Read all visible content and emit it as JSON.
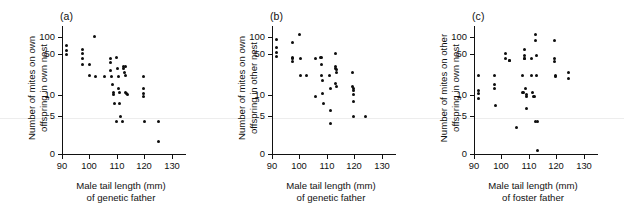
{
  "figure": {
    "background": "#ffffff",
    "point_color": "#0d0d0d",
    "axis_color": "#111111"
  },
  "panels": [
    {
      "key": "a",
      "label": "(a)",
      "ylabel_line1": "Number of mites on own",
      "ylabel_line2": "offspring in own nest",
      "xlabel_line1": "Male tail length (mm)",
      "xlabel_line2": "of genetic father"
    },
    {
      "key": "b",
      "label": "(b)",
      "ylabel_line1": "Number of mites on own",
      "ylabel_line2": "offspring in other nest",
      "xlabel_line1": "Male tail length (mm)",
      "xlabel_line2": "of genetic father"
    },
    {
      "key": "c",
      "label": "(c)",
      "ylabel_line1": "Number of mites on other",
      "ylabel_line2": "offspring in own nest",
      "xlabel_line1": "Male tail length (mm)",
      "xlabel_line2": "of foster father"
    }
  ],
  "chart_data": [
    {
      "type": "scatter",
      "panel": "a",
      "title": "(a)",
      "xlabel": "Male tail length (mm) of genetic father",
      "ylabel": "Number of mites on own offspring in own nest",
      "xlim": [
        90,
        133
      ],
      "xticks": [
        90,
        100,
        110,
        120,
        130
      ],
      "xtick_labels": [
        "90",
        "100",
        "110",
        "120",
        "130"
      ],
      "yscale": "log-like-broken",
      "yticks": [
        0,
        5,
        10,
        50,
        100
      ],
      "ytick_labels": [
        "0",
        "5",
        "10",
        "50",
        "100"
      ],
      "grid": false,
      "legend": null,
      "points": [
        {
          "x": 91.5,
          "y": 70
        },
        {
          "x": 91.5,
          "y": 58
        },
        {
          "x": 91.5,
          "y": 50
        },
        {
          "x": 97.5,
          "y": 60
        },
        {
          "x": 97.5,
          "y": 52
        },
        {
          "x": 97.5,
          "y": 43
        },
        {
          "x": 97.5,
          "y": 33
        },
        {
          "x": 100.0,
          "y": 33
        },
        {
          "x": 100.0,
          "y": 22
        },
        {
          "x": 101.8,
          "y": 100
        },
        {
          "x": 102.2,
          "y": 21
        },
        {
          "x": 105.5,
          "y": 21
        },
        {
          "x": 107.8,
          "y": 43
        },
        {
          "x": 107.8,
          "y": 37
        },
        {
          "x": 107.8,
          "y": 26
        },
        {
          "x": 108.0,
          "y": 21
        },
        {
          "x": 108.5,
          "y": 15
        },
        {
          "x": 108.7,
          "y": 11
        },
        {
          "x": 108.7,
          "y": 10
        },
        {
          "x": 109.0,
          "y": 7.5
        },
        {
          "x": 110.0,
          "y": 45
        },
        {
          "x": 110.3,
          "y": 28
        },
        {
          "x": 110.5,
          "y": 21
        },
        {
          "x": 110.6,
          "y": 13
        },
        {
          "x": 110.8,
          "y": 11
        },
        {
          "x": 111.0,
          "y": 7.5
        },
        {
          "x": 111.3,
          "y": 5
        },
        {
          "x": 110.0,
          "y": 4.3
        },
        {
          "x": 112.0,
          "y": 4.3
        },
        {
          "x": 112.3,
          "y": 31
        },
        {
          "x": 112.5,
          "y": 28
        },
        {
          "x": 112.8,
          "y": 24
        },
        {
          "x": 113.0,
          "y": 22
        },
        {
          "x": 113.2,
          "y": 31
        },
        {
          "x": 113.3,
          "y": 11
        },
        {
          "x": 113.5,
          "y": 10.5
        },
        {
          "x": 114.0,
          "y": 10
        },
        {
          "x": 119.8,
          "y": 21
        },
        {
          "x": 119.8,
          "y": 13
        },
        {
          "x": 119.8,
          "y": 10.5
        },
        {
          "x": 119.8,
          "y": 9.5
        },
        {
          "x": 120.0,
          "y": 4.3
        },
        {
          "x": 125.0,
          "y": 4.3
        },
        {
          "x": 125.0,
          "y": 1.7
        }
      ]
    },
    {
      "type": "scatter",
      "panel": "b",
      "title": "(b)",
      "xlabel": "Male tail length (mm) of genetic father",
      "ylabel": "Number of mites on own offspring in other nest",
      "xlim": [
        90,
        133
      ],
      "xticks": [
        90,
        100,
        110,
        120,
        130
      ],
      "xtick_labels": [
        "90",
        "100",
        "110",
        "120",
        "130"
      ],
      "yscale": "log-like-broken",
      "yticks": [
        0,
        5,
        10,
        50,
        100
      ],
      "ytick_labels": [
        "0",
        "5",
        "10",
        "50",
        "100"
      ],
      "grid": false,
      "legend": null,
      "points": [
        {
          "x": 91.5,
          "y": 90
        },
        {
          "x": 91.5,
          "y": 65
        },
        {
          "x": 91.5,
          "y": 55
        },
        {
          "x": 91.5,
          "y": 47
        },
        {
          "x": 97.5,
          "y": 80
        },
        {
          "x": 97.5,
          "y": 45
        },
        {
          "x": 97.5,
          "y": 42
        },
        {
          "x": 97.5,
          "y": 38
        },
        {
          "x": 100.2,
          "y": 110
        },
        {
          "x": 100.5,
          "y": 43
        },
        {
          "x": 100.5,
          "y": 22
        },
        {
          "x": 102.5,
          "y": 22
        },
        {
          "x": 106.0,
          "y": 43
        },
        {
          "x": 106.0,
          "y": 9.5
        },
        {
          "x": 107.8,
          "y": 44
        },
        {
          "x": 108.2,
          "y": 44
        },
        {
          "x": 108.0,
          "y": 33
        },
        {
          "x": 108.2,
          "y": 22
        },
        {
          "x": 108.3,
          "y": 18
        },
        {
          "x": 108.5,
          "y": 10.5
        },
        {
          "x": 108.8,
          "y": 7.5
        },
        {
          "x": 111.0,
          "y": 22
        },
        {
          "x": 111.2,
          "y": 13
        },
        {
          "x": 111.2,
          "y": 6
        },
        {
          "x": 111.3,
          "y": 4
        },
        {
          "x": 113.0,
          "y": 52
        },
        {
          "x": 113.2,
          "y": 31
        },
        {
          "x": 113.3,
          "y": 28
        },
        {
          "x": 113.5,
          "y": 27
        },
        {
          "x": 113.5,
          "y": 24
        },
        {
          "x": 113.2,
          "y": 16
        },
        {
          "x": 113.4,
          "y": 14
        },
        {
          "x": 119.5,
          "y": 24
        },
        {
          "x": 119.5,
          "y": 14
        },
        {
          "x": 119.7,
          "y": 13
        },
        {
          "x": 119.8,
          "y": 12
        },
        {
          "x": 119.8,
          "y": 10
        },
        {
          "x": 119.8,
          "y": 8
        },
        {
          "x": 119.8,
          "y": 5
        },
        {
          "x": 124.0,
          "y": 5
        }
      ]
    },
    {
      "type": "scatter",
      "panel": "c",
      "title": "(c)",
      "xlabel": "Male tail length (mm) of foster father",
      "ylabel": "Number of mites on other offspring in own nest",
      "xlim": [
        90,
        133
      ],
      "xticks": [
        90,
        100,
        110,
        120,
        130
      ],
      "xtick_labels": [
        "90",
        "100",
        "110",
        "120",
        "130"
      ],
      "yscale": "log-like-broken",
      "yticks": [
        0,
        5,
        10,
        50,
        100
      ],
      "ytick_labels": [
        "0",
        "5",
        "10",
        "50",
        "100"
      ],
      "grid": false,
      "legend": null,
      "points": [
        {
          "x": 91.5,
          "y": 22
        },
        {
          "x": 91.5,
          "y": 12
        },
        {
          "x": 91.5,
          "y": 10.5
        },
        {
          "x": 91.5,
          "y": 9
        },
        {
          "x": 97.5,
          "y": 22
        },
        {
          "x": 97.5,
          "y": 15
        },
        {
          "x": 97.5,
          "y": 13
        },
        {
          "x": 97.8,
          "y": 7
        },
        {
          "x": 101.5,
          "y": 52
        },
        {
          "x": 101.5,
          "y": 43
        },
        {
          "x": 102.8,
          "y": 40
        },
        {
          "x": 103.0,
          "y": 40
        },
        {
          "x": 105.5,
          "y": 3.5
        },
        {
          "x": 107.5,
          "y": 22
        },
        {
          "x": 107.5,
          "y": 11
        },
        {
          "x": 108.0,
          "y": 11
        },
        {
          "x": 108.5,
          "y": 60
        },
        {
          "x": 108.5,
          "y": 48
        },
        {
          "x": 108.5,
          "y": 43
        },
        {
          "x": 108.5,
          "y": 42
        },
        {
          "x": 108.8,
          "y": 13
        },
        {
          "x": 109.0,
          "y": 10
        },
        {
          "x": 109.2,
          "y": 9.5
        },
        {
          "x": 109.2,
          "y": 6.5
        },
        {
          "x": 111.0,
          "y": 43
        },
        {
          "x": 111.0,
          "y": 22
        },
        {
          "x": 111.2,
          "y": 11
        },
        {
          "x": 111.5,
          "y": 9.5
        },
        {
          "x": 112.0,
          "y": 9.5
        },
        {
          "x": 112.5,
          "y": 110
        },
        {
          "x": 112.5,
          "y": 88
        },
        {
          "x": 112.8,
          "y": 48
        },
        {
          "x": 112.8,
          "y": 22
        },
        {
          "x": 112.5,
          "y": 4.3
        },
        {
          "x": 113.2,
          "y": 4.3
        },
        {
          "x": 113.0,
          "y": 0.5
        },
        {
          "x": 119.5,
          "y": 85
        },
        {
          "x": 119.5,
          "y": 43
        },
        {
          "x": 119.5,
          "y": 38
        },
        {
          "x": 119.8,
          "y": 22
        },
        {
          "x": 119.8,
          "y": 21
        },
        {
          "x": 124.5,
          "y": 24
        },
        {
          "x": 124.5,
          "y": 19
        }
      ]
    }
  ]
}
